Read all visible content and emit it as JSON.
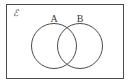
{
  "diagram": {
    "type": "venn",
    "background_color": "#ffffff",
    "stroke_color": "#4a4a4a",
    "label_color": "#3a3a3a",
    "universe": {
      "label": "ℰ",
      "label_name": "universal-set-symbol",
      "x": 6,
      "y": 4,
      "width": 117,
      "height": 74,
      "stroke_width": 1,
      "label_x": 13,
      "label_y": 16,
      "label_font_size": 9
    },
    "sets": [
      {
        "label": "A",
        "cx": 54,
        "cy": 46,
        "r": 22.5,
        "stroke_width": 1,
        "label_x": 54,
        "label_y": 22,
        "label_font_size": 10
      },
      {
        "label": "B",
        "cx": 80,
        "cy": 46,
        "r": 22.5,
        "stroke_width": 1,
        "label_x": 80,
        "label_y": 22,
        "label_font_size": 10
      }
    ],
    "regions": {
      "intersection_label": "",
      "filled": false
    }
  }
}
